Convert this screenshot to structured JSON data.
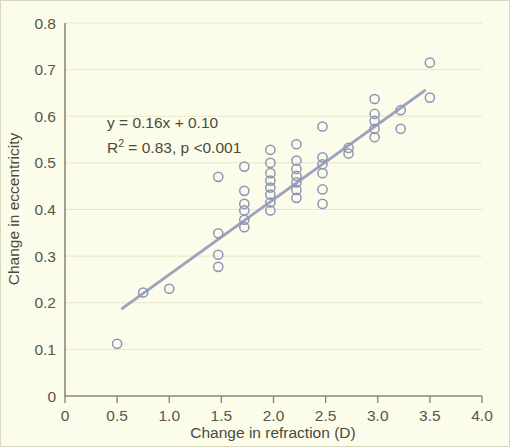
{
  "chart_data": {
    "type": "scatter",
    "title": "",
    "xlabel": "Change in refraction (D)",
    "ylabel": "Change in eccentricity",
    "xlim": [
      0,
      4.0
    ],
    "ylim": [
      0,
      0.8
    ],
    "xticks": [
      "0",
      "0.5",
      "1.0",
      "1.5",
      "2.0",
      "2.5",
      "3.0",
      "3.5",
      "4.0"
    ],
    "xtick_values": [
      0,
      0.5,
      1.0,
      1.5,
      2.0,
      2.5,
      3.0,
      3.5,
      4.0
    ],
    "yticks": [
      "0",
      "0.1",
      "0.2",
      "0.3",
      "0.4",
      "0.5",
      "0.6",
      "0.7",
      "0.8"
    ],
    "ytick_values": [
      0,
      0.1,
      0.2,
      0.3,
      0.4,
      0.5,
      0.6,
      0.7,
      0.8
    ],
    "grid": true,
    "grid_axis": "y",
    "legend": false,
    "marker": "open-circle",
    "marker_color": "#8e96b4",
    "trendline_color": "#9aa4bd",
    "background_color": "#fcfcea",
    "annotations": [
      "y = 0.16x + 0.10",
      "R² = 0.83, p <0.001"
    ],
    "equation": {
      "slope": 0.16,
      "intercept": 0.1,
      "r_squared": 0.83,
      "p_value": "<0.001",
      "line1": "y = 0.16x + 0.10",
      "line2_prefix": "R",
      "line2_sup": "2",
      "line2_rest": " = 0.83, p <0.001"
    },
    "trendline": {
      "x_start": 0.55,
      "y_start": 0.188,
      "x_end": 3.45,
      "y_end": 0.655
    },
    "points": [
      [
        0.5,
        0.112
      ],
      [
        0.75,
        0.222
      ],
      [
        1.0,
        0.23
      ],
      [
        1.47,
        0.277
      ],
      [
        1.47,
        0.303
      ],
      [
        1.47,
        0.349
      ],
      [
        1.47,
        0.47
      ],
      [
        1.72,
        0.362
      ],
      [
        1.72,
        0.378
      ],
      [
        1.72,
        0.398
      ],
      [
        1.72,
        0.412
      ],
      [
        1.72,
        0.44
      ],
      [
        1.72,
        0.492
      ],
      [
        1.97,
        0.398
      ],
      [
        1.97,
        0.415
      ],
      [
        1.97,
        0.432
      ],
      [
        1.97,
        0.447
      ],
      [
        1.97,
        0.462
      ],
      [
        1.97,
        0.478
      ],
      [
        1.97,
        0.5
      ],
      [
        1.97,
        0.528
      ],
      [
        2.22,
        0.425
      ],
      [
        2.22,
        0.442
      ],
      [
        2.22,
        0.458
      ],
      [
        2.22,
        0.472
      ],
      [
        2.22,
        0.487
      ],
      [
        2.22,
        0.505
      ],
      [
        2.22,
        0.54
      ],
      [
        2.47,
        0.412
      ],
      [
        2.47,
        0.443
      ],
      [
        2.47,
        0.478
      ],
      [
        2.47,
        0.497
      ],
      [
        2.47,
        0.512
      ],
      [
        2.47,
        0.578
      ],
      [
        2.72,
        0.52
      ],
      [
        2.72,
        0.532
      ],
      [
        2.97,
        0.555
      ],
      [
        2.97,
        0.573
      ],
      [
        2.97,
        0.59
      ],
      [
        2.97,
        0.605
      ],
      [
        2.97,
        0.637
      ],
      [
        3.22,
        0.573
      ],
      [
        3.22,
        0.613
      ],
      [
        3.5,
        0.64
      ],
      [
        3.5,
        0.715
      ]
    ]
  },
  "axes": {
    "x_title": "Change in refraction (D)",
    "y_title": "Change in eccentricity"
  }
}
